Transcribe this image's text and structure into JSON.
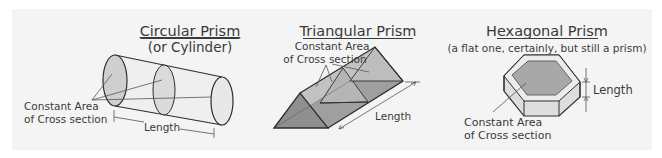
{
  "figures": [
    {
      "title": "Circular Prism",
      "subtitle": "(or Cylinder)",
      "labels": {
        "cross_section_1": "Constant Area",
        "cross_section_2": "of Cross section",
        "length": "Length"
      }
    },
    {
      "title": "Triangular Prism",
      "labels": {
        "cross_section_1": "Constant Area",
        "cross_section_2": "of Cross section",
        "length": "Length"
      }
    },
    {
      "title": "Hexagonal Prism",
      "subtitle": "(a flat one, certainly, but still a prism)",
      "labels": {
        "cross_section_1": "Constant Area",
        "cross_section_2": "of Cross section",
        "length": "Length"
      }
    }
  ],
  "colors": {
    "background": "#ffffff",
    "panel": "#f4f4f4",
    "outline": "#2e2e2e",
    "face_light": "#e6e6e6",
    "face_mid": "#c9c9c9",
    "face_dark": "#a9a9a9",
    "text": "#3a3a3a"
  }
}
